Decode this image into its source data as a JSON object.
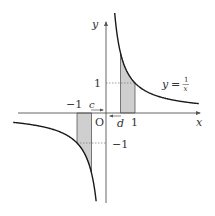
{
  "diagram": {
    "function_label": "y = 1/x",
    "function_label_parts": {
      "lhs": "y",
      "eq": "=",
      "num": "1",
      "den": "x"
    },
    "axes": {
      "x_label": "x",
      "y_label": "y",
      "origin_label": "O"
    },
    "ticks": {
      "x_pos": "1",
      "x_neg": "−1",
      "y_pos": "1",
      "y_neg": "−1"
    },
    "points": {
      "c_label": "c",
      "d_label": "d"
    },
    "values": {
      "c": -0.5,
      "d": 0.5
    },
    "colors": {
      "curve": "#1a1a1a",
      "axis": "#555555",
      "shade": "#cfcfcf",
      "dotted": "#777777"
    }
  }
}
